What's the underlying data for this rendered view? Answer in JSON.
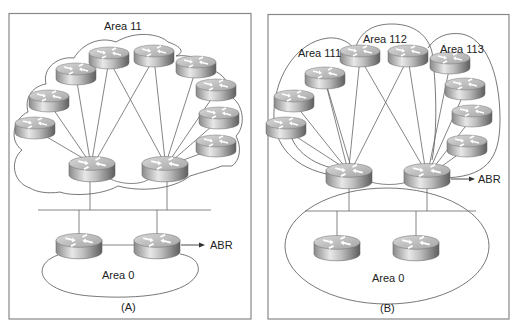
{
  "panels": [
    {
      "id": "A",
      "caption": "(A)",
      "areas": [
        {
          "label": "Area 11"
        },
        {
          "label": "Area 0"
        }
      ],
      "abr_label": "ABR"
    },
    {
      "id": "B",
      "caption": "(B)",
      "areas": [
        {
          "label": "Area 111"
        },
        {
          "label": "Area 112"
        },
        {
          "label": "Area 113"
        },
        {
          "label": "Area 0"
        }
      ],
      "abr_label": "ABR"
    }
  ],
  "icons": {
    "router": "router-icon",
    "arrow": "arrow-right-icon"
  },
  "colors": {
    "router_top": "#c8c8c8",
    "router_side_dark": "#6e6e6e",
    "router_side_light": "#e6e6e6",
    "line": "#666666",
    "panel_border": "#888888"
  }
}
